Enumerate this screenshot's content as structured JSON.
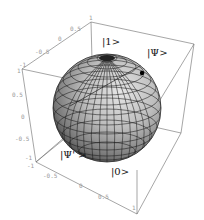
{
  "figure": {
    "labels": {
      "north": "|1>",
      "psi": "|Ψ>",
      "psi_prime": "|Ψ' >",
      "south": "|0>"
    },
    "axis_ticks": {
      "top_edge": [
        "-1",
        "-0.5",
        "0",
        "0.5",
        "1"
      ],
      "left_edge": [
        "1",
        "0.5",
        "0",
        "-0.5",
        "-1"
      ],
      "bottom_edge": [
        "-1",
        "-0.5",
        "0",
        "0.5",
        "1"
      ]
    },
    "colors": {
      "sphere_light": "#d8d8d8",
      "sphere_mid": "#9a9a9a",
      "sphere_dark": "#3c3c3c",
      "box": "#6a6a6a",
      "tick_text": "#9a9a9a",
      "label_text": "#111111",
      "psi_point": "#000000"
    }
  }
}
